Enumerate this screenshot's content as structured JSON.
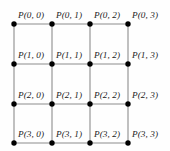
{
  "figure": {
    "type": "grid-lattice-diagram",
    "rows": 4,
    "cols": 4,
    "colors": {
      "background": "#fefefe",
      "edge": "#8c8c8c",
      "node": "#000000",
      "label": "#1a1a1a"
    },
    "geometry": {
      "x_positions": [
        14,
        52,
        90,
        128
      ],
      "y_positions": [
        24,
        64,
        104,
        143
      ],
      "node_radius": 2.7,
      "edge_width": 1.1,
      "label_dx": 4,
      "label_dy": -4
    }
  },
  "chart_data": {
    "type": "scatter",
    "title": "",
    "xlabel": "",
    "ylabel": "",
    "grid": true,
    "legend": null,
    "x": [
      14,
      52,
      90,
      128
    ],
    "y": [
      24,
      64,
      104,
      143
    ],
    "series": [
      {
        "name": "row 0",
        "values": [
          24,
          24,
          24,
          24
        ]
      },
      {
        "name": "row 1",
        "values": [
          64,
          64,
          64,
          64
        ]
      },
      {
        "name": "row 2",
        "values": [
          104,
          104,
          104,
          104
        ]
      },
      {
        "name": "row 3",
        "values": [
          143,
          143,
          143,
          143
        ]
      }
    ]
  },
  "nodes": [
    {
      "label": "P(0, 0)",
      "row": 0,
      "col": 0,
      "x": 14,
      "y": 24
    },
    {
      "label": "P(0, 1)",
      "row": 0,
      "col": 1,
      "x": 52,
      "y": 24
    },
    {
      "label": "P(0, 2)",
      "row": 0,
      "col": 2,
      "x": 90,
      "y": 24
    },
    {
      "label": "P(0, 3)",
      "row": 0,
      "col": 3,
      "x": 128,
      "y": 24
    },
    {
      "label": "P(1, 0)",
      "row": 1,
      "col": 0,
      "x": 14,
      "y": 64
    },
    {
      "label": "P(1, 1)",
      "row": 1,
      "col": 1,
      "x": 52,
      "y": 64
    },
    {
      "label": "P(1, 2)",
      "row": 1,
      "col": 2,
      "x": 90,
      "y": 64
    },
    {
      "label": "P(1, 3)",
      "row": 1,
      "col": 3,
      "x": 128,
      "y": 64
    },
    {
      "label": "P(2, 0)",
      "row": 2,
      "col": 0,
      "x": 14,
      "y": 104
    },
    {
      "label": "P(2, 1)",
      "row": 2,
      "col": 1,
      "x": 52,
      "y": 104
    },
    {
      "label": "P(2, 2)",
      "row": 2,
      "col": 2,
      "x": 90,
      "y": 104
    },
    {
      "label": "P(2, 3)",
      "row": 2,
      "col": 3,
      "x": 128,
      "y": 104
    },
    {
      "label": "P(3, 0)",
      "row": 3,
      "col": 0,
      "x": 14,
      "y": 143
    },
    {
      "label": "P(3, 1)",
      "row": 3,
      "col": 1,
      "x": 52,
      "y": 143
    },
    {
      "label": "P(3, 2)",
      "row": 3,
      "col": 2,
      "x": 90,
      "y": 143
    },
    {
      "label": "P(3, 3)",
      "row": 3,
      "col": 3,
      "x": 128,
      "y": 143
    }
  ]
}
